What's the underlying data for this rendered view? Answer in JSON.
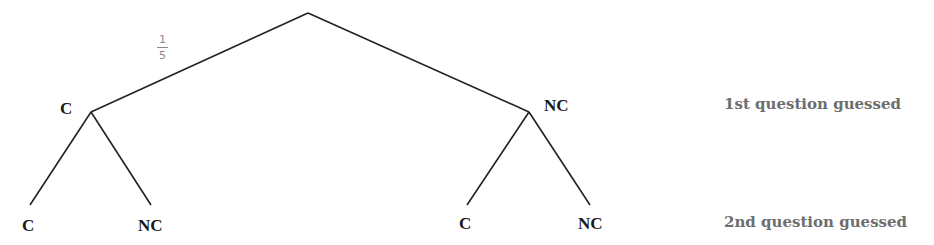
{
  "diagram": {
    "type": "probability-tree",
    "line_color": "#222222",
    "root": {
      "x": 308,
      "y": 13
    },
    "branch_probability": {
      "numerator": "1",
      "denominator": "5"
    },
    "level1": [
      {
        "label": "C",
        "x": 91,
        "y": 112
      },
      {
        "label": "NC",
        "x": 529,
        "y": 112
      }
    ],
    "level2": [
      {
        "label": "C",
        "parent": 0,
        "x": 30,
        "y": 205
      },
      {
        "label": "NC",
        "parent": 0,
        "x": 151,
        "y": 205
      },
      {
        "label": "C",
        "parent": 1,
        "x": 467,
        "y": 205
      },
      {
        "label": "NC",
        "parent": 1,
        "x": 590,
        "y": 205
      }
    ],
    "level_labels": {
      "level1": "1st question guessed",
      "level2": "2nd question guessed"
    }
  }
}
